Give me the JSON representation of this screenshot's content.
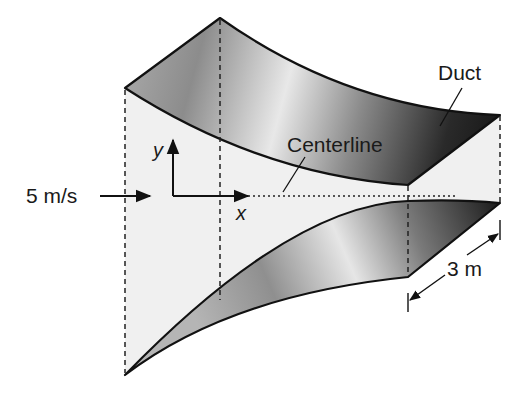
{
  "figure": {
    "labels": {
      "duct": "Duct",
      "centerline": "Centerline",
      "inlet_velocity": "5 m/s",
      "depth": "3 m",
      "y_axis": "y",
      "x_axis": "x"
    },
    "colors": {
      "background": "#ffffff",
      "inner_face": "#f0f0f0",
      "outline": "#111111",
      "shade_dark": "#222222",
      "shade_mid": "#8a8a8a",
      "shade_light": "#e6e6e6"
    }
  }
}
